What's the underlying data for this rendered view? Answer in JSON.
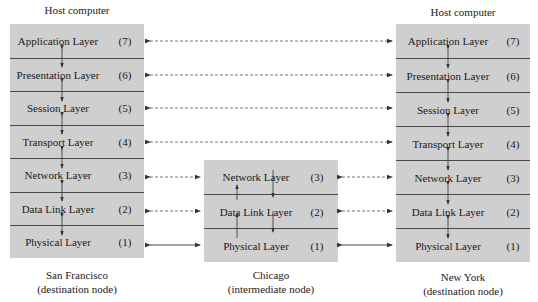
{
  "nodes": {
    "left": {
      "title": "Host computer",
      "caption_line1": "San Francisco",
      "caption_line2": "(destination node)",
      "layers": [
        {
          "name": "Application Layer",
          "num": "(7)"
        },
        {
          "name": "Presentation Layer",
          "num": "(6)"
        },
        {
          "name": "Session Layer",
          "num": "(5)"
        },
        {
          "name": "Transport Layer",
          "num": "(4)"
        },
        {
          "name": "Network Layer",
          "num": "(3)"
        },
        {
          "name": "Data Link Layer",
          "num": "(2)"
        },
        {
          "name": "Physical Layer",
          "num": "(1)"
        }
      ]
    },
    "middle": {
      "caption_line1": "Chicago",
      "caption_line2": "(intermediate node)",
      "layers": [
        {
          "name": "Network Layer",
          "num": "(3)"
        },
        {
          "name": "Data Link Layer",
          "num": "(2)"
        },
        {
          "name": "Physical Layer",
          "num": "(1)"
        }
      ]
    },
    "right": {
      "title": "Host computer",
      "caption_line1": "New York",
      "caption_line2": "(destination node)",
      "layers": [
        {
          "name": "Application Layer",
          "num": "(7)"
        },
        {
          "name": "Presentation Layer",
          "num": "(6)"
        },
        {
          "name": "Session Layer",
          "num": "(5)"
        },
        {
          "name": "Transport Layer",
          "num": "(4)"
        },
        {
          "name": "Network Layer",
          "num": "(3)"
        },
        {
          "name": "Data Link Layer",
          "num": "(2)"
        },
        {
          "name": "Physical Layer",
          "num": "(1)"
        }
      ]
    }
  },
  "connections": {
    "peer_links": [
      "Application",
      "Presentation",
      "Session",
      "Transport",
      "Network",
      "Data Link"
    ],
    "physical_link": "Physical",
    "peer_style": "dashed",
    "physical_style": "solid"
  },
  "colors": {
    "box_fill": "#cfcfcf",
    "divider": "#4a4a4a",
    "line": "#333333"
  }
}
